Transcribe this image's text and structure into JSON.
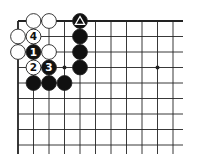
{
  "diagram": {
    "type": "go-board-fragment",
    "grid": {
      "origin_x": 18,
      "origin_y": 21,
      "spacing": 15.5,
      "columns": 11,
      "rows": 9,
      "extend_right_to": 183,
      "extend_bottom_to": 154,
      "edges": [
        "top",
        "left"
      ]
    },
    "colors": {
      "line": "#222222",
      "black_stone": "#111111",
      "white_stone": "#ffffff",
      "stone_outline": "#222222"
    },
    "star_points": [
      {
        "col": 3,
        "row": 3
      },
      {
        "col": 9,
        "row": 3
      }
    ],
    "stones": [
      {
        "color": "white",
        "col": 1,
        "row": 0,
        "label": ""
      },
      {
        "color": "white",
        "col": 2,
        "row": 0,
        "label": ""
      },
      {
        "color": "white",
        "col": 0,
        "row": 1,
        "label": ""
      },
      {
        "color": "white",
        "col": 1,
        "row": 1,
        "label": "4"
      },
      {
        "color": "white",
        "col": 0,
        "row": 2,
        "label": ""
      },
      {
        "color": "black",
        "col": 1,
        "row": 2,
        "label": "1"
      },
      {
        "color": "white",
        "col": 2,
        "row": 2,
        "label": ""
      },
      {
        "color": "white",
        "col": 1,
        "row": 3,
        "label": "2"
      },
      {
        "color": "black",
        "col": 2,
        "row": 3,
        "label": "3"
      },
      {
        "color": "black",
        "col": 1,
        "row": 4,
        "label": ""
      },
      {
        "color": "black",
        "col": 2,
        "row": 4,
        "label": ""
      },
      {
        "color": "black",
        "col": 3,
        "row": 4,
        "label": ""
      },
      {
        "color": "black",
        "col": 4,
        "row": 0,
        "label": "",
        "marker": "triangle"
      },
      {
        "color": "black",
        "col": 4,
        "row": 1,
        "label": ""
      },
      {
        "color": "black",
        "col": 4,
        "row": 2,
        "label": ""
      },
      {
        "color": "black",
        "col": 4,
        "row": 3,
        "label": ""
      }
    ]
  },
  "caption": ""
}
